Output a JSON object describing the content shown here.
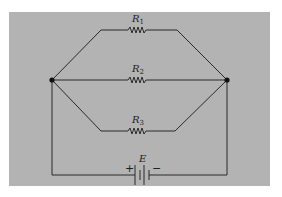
{
  "diagram": {
    "type": "circuit-schematic",
    "background_color": "#b3b3b3",
    "line_color": "#2a2a2a",
    "components": [
      {
        "id": "R1",
        "type": "resistor",
        "label": "R",
        "subscript": "1",
        "branch": "top"
      },
      {
        "id": "R2",
        "type": "resistor",
        "label": "R",
        "subscript": "2",
        "branch": "middle"
      },
      {
        "id": "R3",
        "type": "resistor",
        "label": "R",
        "subscript": "3",
        "branch": "bottom"
      },
      {
        "id": "E",
        "type": "battery",
        "label": "E",
        "positive": "+",
        "negative": "−"
      }
    ],
    "nodes": [
      {
        "id": "left-junction",
        "x": 52,
        "y": 80
      },
      {
        "id": "right-junction",
        "x": 227,
        "y": 80
      }
    ]
  }
}
